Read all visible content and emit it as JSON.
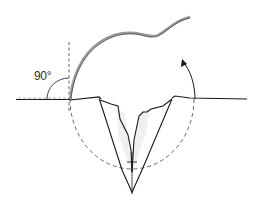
{
  "diagram": {
    "type": "surgical-flap-illustration",
    "labels": {
      "angle": "90°"
    },
    "colors": {
      "stroke": "#1a1a1a",
      "flap": "#8a8a8a",
      "dashed": "#555555",
      "fill": "#eeeeee"
    },
    "elements": [
      "skin-surface-line",
      "vertical-reference-line",
      "right-angle-arc",
      "raised-flap",
      "rotation-circle",
      "rotation-arrow",
      "v-shaped-excision"
    ]
  }
}
